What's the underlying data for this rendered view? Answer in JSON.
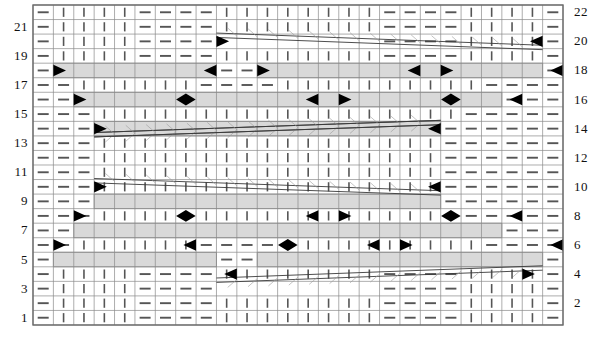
{
  "chart_data": {
    "type": "table",
    "columns": 26,
    "rows": 22,
    "left_row_labels": [
      "21",
      "19",
      "17",
      "15",
      "13",
      "11",
      "9",
      "7",
      "5",
      "3",
      "1"
    ],
    "right_row_labels": [
      "22",
      "20",
      "18",
      "16",
      "14",
      "12",
      "10",
      "8",
      "6",
      "4",
      "2"
    ],
    "symbols": {
      "purl": "—",
      "knit": "|",
      "cable_band": "gray-diagonal-band",
      "crossing_right": "black-right-triangle",
      "crossing_left": "black-left-triangle",
      "peak": "black-diamond"
    },
    "colors": {
      "band_fill": "#d9d9d9",
      "grid_line": "#8a8a8a",
      "border": "#6b6b6b",
      "symbol": "#555555",
      "marker": "#000000",
      "background": "#ffffff"
    },
    "geometry": {
      "grid_left": 33,
      "grid_top": 5,
      "grid_right": 563,
      "grid_bottom": 325,
      "cell_width": 20.385,
      "cell_height": 14.545
    },
    "grid": [
      "PKKKKPPPPKKKKKKKKPPPPKKKKP",
      "PKKKKPPPPKKKKKKKKPPPPKKKKP",
      "PKKKKPPPPTTTTTTTTPPPPKKKKP",
      "PKKKKPPPPKKKKKKKKPPPPKKKKP",
      "PCCCCCCCCPPCCCCCCCCCCCCCCP",
      "PPKKKKKKPPPPKKKKKKKKKKPPPP",
      "PPCCCCCCCCCCCCCCCCCCCCCPPP",
      "PPPKKKKKKKKKKKKKKKKKKPPPPP",
      "PPPTTTTTTTTTTTTTTTTTPPPPPP",
      "PPPKKKKKKKKKKKKKKKKKPPPPPP",
      "PPPKKKKKKKKKKKKKKKKKPPPPPP",
      "PPPKKKKKKKKKKKKKKKKKPPPPPP",
      "PPPKKKKKKKKKKKKKKKKKPPPPPP",
      "PPPTTTTTTTTTTTTTTTTTPPPPPP",
      "PPPKKKKKKKKKKKKKKKKKPPPPPP",
      "PPCCCCCCCCCCCCCCCCCCCCCPPP",
      "PPKKKKKKPPPPKKKKKKKKKKPPPP",
      "PCCCCCCCCPPCCCCCCCCCCCCCCP",
      "PKKKKPPPPKKKKKKKKPPPPKKKKP",
      "PKKKKPPPPTTTTTTTTPPPPKKKKP",
      "PKKKKPPPPKKKKKKKKPPPPKKKKP",
      "PKKKKPPPPKKKKKKKKPPPPKKKKP"
    ]
  }
}
